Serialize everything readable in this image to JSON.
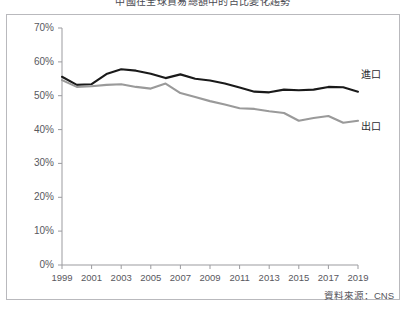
{
  "chart_data": {
    "type": "line",
    "title": "中國在全球貿易總額中的占比變化趨勢",
    "xlabel": "",
    "ylabel": "",
    "ylim": [
      0,
      70
    ],
    "ytick_values": [
      0,
      10,
      20,
      30,
      40,
      50,
      60,
      70
    ],
    "ytick_labels": [
      "0%",
      "10%",
      "20%",
      "30%",
      "40%",
      "50%",
      "60%",
      "70%"
    ],
    "xlim": [
      1999,
      2019
    ],
    "x": [
      1999,
      2000,
      2001,
      2002,
      2003,
      2004,
      2005,
      2006,
      2007,
      2008,
      2009,
      2010,
      2011,
      2012,
      2013,
      2014,
      2015,
      2016,
      2017,
      2018,
      2019
    ],
    "xtick_labels": [
      "1999",
      "2001",
      "2003",
      "2005",
      "2007",
      "2009",
      "2011",
      "2013",
      "2015",
      "2017",
      "2019"
    ],
    "xtick_values": [
      1999,
      2001,
      2003,
      2005,
      2007,
      2009,
      2011,
      2013,
      2015,
      2017,
      2019
    ],
    "grid": false,
    "legend_position": "inline-right",
    "series": [
      {
        "name": "進口",
        "label": "進口",
        "color": "#1a1a1a",
        "values": [
          55.6,
          53.2,
          53.4,
          56.4,
          57.8,
          57.4,
          56.5,
          55.2,
          56.3,
          55.0,
          54.5,
          53.6,
          52.4,
          51.2,
          51.0,
          51.8,
          51.6,
          51.8,
          52.6,
          52.5,
          51.2
        ]
      },
      {
        "name": "出口",
        "label": "出口",
        "color": "#9a9a9a",
        "values": [
          54.6,
          52.6,
          52.8,
          53.2,
          53.4,
          52.6,
          52.1,
          53.6,
          50.8,
          49.6,
          48.4,
          47.4,
          46.3,
          46.1,
          45.4,
          44.9,
          42.6,
          43.4,
          44.0,
          42.0,
          42.6
        ]
      }
    ],
    "source": "資料來源：CNS"
  }
}
